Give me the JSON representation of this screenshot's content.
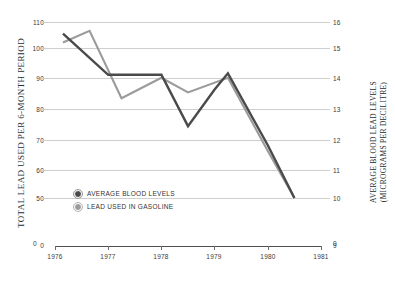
{
  "chart_data": {
    "type": "line",
    "title": "",
    "subtitle": "",
    "xlabel": "",
    "ylabel": "TOTAL LEAD USED PER 6-MONTH PERIOD",
    "ylabel_right_line1": "AVERAGE BLOOD LEAD LEVELS",
    "ylabel_right_line2": "(MICROGRAMS PER DECILITRE)",
    "grid": true,
    "legend_position": "inside-lower-left",
    "x": [
      1976.15,
      1976.65,
      1977.0,
      1977.25,
      1977.5,
      1978.0,
      1978.5,
      1979.0,
      1979.5,
      1980.0,
      1980.5
    ],
    "xlim": [
      1976,
      1981
    ],
    "xticks": [
      "1976",
      "1977",
      "1978",
      "1979",
      "1980",
      "1981"
    ],
    "xtick_values": [
      1976,
      1977,
      1978,
      1979,
      1980,
      1981
    ],
    "left_axis": {
      "label": "TOTAL LEAD USED PER 6-MONTH PERIOD",
      "ticks": [
        "110",
        "100",
        "90",
        "80",
        "70",
        "60",
        "50",
        "0"
      ],
      "tick_values": [
        110,
        100,
        90,
        80,
        70,
        60,
        50,
        0
      ],
      "ylim": [
        50,
        110
      ]
    },
    "right_axis": {
      "label": "AVERAGE BLOOD LEAD LEVELS (MICROGRAMS PER DECILITRE)",
      "ticks": [
        "16",
        "15",
        "14",
        "13",
        "12",
        "11",
        "10",
        "9"
      ],
      "tick_values": [
        16,
        15,
        14,
        13,
        12,
        11,
        10,
        9
      ],
      "ylim": [
        10,
        16
      ]
    },
    "series": [
      {
        "name": "AVERAGE BLOOD LEVELS",
        "axis": "right",
        "color": "#4a4a4a",
        "points": [
          {
            "x": 1976.15,
            "left_scale": 106.0,
            "value": 15.6
          },
          {
            "x": 1977.0,
            "left_scale": 92.0,
            "value": 14.2
          },
          {
            "x": 1977.5,
            "left_scale": 92.0,
            "value": 14.2
          },
          {
            "x": 1978.0,
            "left_scale": 92.0,
            "value": 14.2
          },
          {
            "x": 1978.5,
            "left_scale": 74.5,
            "value": 12.45
          },
          {
            "x": 1979.0,
            "left_scale": 87.0,
            "value": 13.7
          },
          {
            "x": 1979.25,
            "left_scale": 92.5,
            "value": 14.25
          },
          {
            "x": 1980.0,
            "left_scale": 68.0,
            "value": 11.8
          },
          {
            "x": 1980.5,
            "left_scale": 50.0,
            "value": 10.0
          }
        ]
      },
      {
        "name": "LEAD USED IN GASOLINE",
        "axis": "left",
        "color": "#9b9b9b",
        "points": [
          {
            "x": 1976.15,
            "value": 103.0
          },
          {
            "x": 1976.65,
            "value": 107.0
          },
          {
            "x": 1977.25,
            "value": 84.0
          },
          {
            "x": 1978.0,
            "value": 91.0
          },
          {
            "x": 1978.5,
            "value": 86.0
          },
          {
            "x": 1979.25,
            "value": 91.0
          },
          {
            "x": 1980.0,
            "value": 66.0
          },
          {
            "x": 1980.5,
            "value": 50.0
          }
        ]
      }
    ]
  },
  "legend": {
    "items": [
      {
        "label": "AVERAGE BLOOD LEVELS",
        "color": "#4a4a4a"
      },
      {
        "label": "LEAD USED IN GASOLINE",
        "color": "#9b9b9b"
      }
    ]
  },
  "axes": {
    "zero_left": "0",
    "zero_right": "0"
  }
}
